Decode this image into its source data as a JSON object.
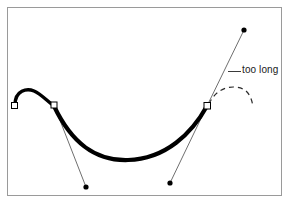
{
  "figure": {
    "background_color": "#ffffff",
    "frame": {
      "name": "figure-border",
      "x": 7,
      "y": 7,
      "width": 275,
      "height": 189,
      "stroke_color": "#9a9a9a",
      "stroke_width": 1
    },
    "annotation": {
      "text": "too long",
      "leader_line_color": "#3a3a3a",
      "text_color": "#1a1a1a"
    },
    "curve": {
      "name": "bezier-path",
      "stroke_color": "#000000",
      "stroke_width_max": 4.2,
      "description": "Thick black bezier curve with a small hump on the left and a long sweeping valley to the right"
    },
    "dashed_arc": {
      "name": "suggested-curve-preview",
      "stroke_color": "#2b2b2b",
      "dash_pattern": "5 4",
      "description": "Dashed arc indicating the curve shape produced by the over-long handle"
    },
    "anchor_points": [
      {
        "label": "anchor-1",
        "x": 14,
        "y": 105
      },
      {
        "label": "anchor-2",
        "x": 54,
        "y": 105
      },
      {
        "label": "anchor-3",
        "x": 207,
        "y": 106
      }
    ],
    "control_handles": [
      {
        "label": "handle-lower-left",
        "anchor_x": 54,
        "anchor_y": 105,
        "point_x": 86,
        "point_y": 187
      },
      {
        "label": "handle-lower-right",
        "anchor_x": 207,
        "anchor_y": 106,
        "point_x": 170,
        "point_y": 183
      },
      {
        "label": "handle-upper-right-too-long",
        "anchor_x": 207,
        "anchor_y": 106,
        "point_x": 244,
        "point_y": 30
      }
    ],
    "marker_style": {
      "anchor_fill": "#ffffff",
      "anchor_stroke": "#000000",
      "anchor_size": 6,
      "handle_dot_fill": "#000000",
      "handle_dot_radius": 2.6,
      "handle_line_color": "#6f6f6f"
    }
  }
}
